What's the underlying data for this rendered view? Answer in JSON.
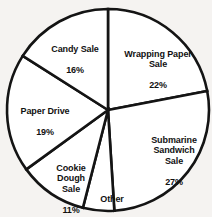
{
  "chart_data": {
    "type": "pie",
    "title": "",
    "subtitle": "",
    "xlabel": "",
    "ylabel": "",
    "legend_position": "none",
    "labels_inside": true,
    "units": "percent",
    "total": 100,
    "start_angle_deg": 0,
    "direction": "clockwise",
    "categories": [
      "Wrapping Paper Sale",
      "Submarine Sandwich Sale",
      "Other",
      "Cookie Dough Sale",
      "Paper Drive",
      "Candy Sale"
    ],
    "values": [
      22,
      27,
      5,
      11,
      19,
      16
    ],
    "slices": [
      {
        "key": "wrapping-paper",
        "name": "Wrapping Paper Sale",
        "name_lines": "Wrapping Paper\nSale",
        "value": 22,
        "value_label": "22%",
        "fill": "#ffffff",
        "stroke": "#141414"
      },
      {
        "key": "submarine",
        "name": "Submarine Sandwich Sale",
        "name_lines": "Submarine\nSandwich\nSale",
        "value": 27,
        "value_label": "27%",
        "fill": "#ffffff",
        "stroke": "#141414"
      },
      {
        "key": "other",
        "name": "Other",
        "name_lines": "Other",
        "value": 5,
        "value_label": "5%",
        "fill": "#ffffff",
        "stroke": "#141414"
      },
      {
        "key": "cookie-dough",
        "name": "Cookie Dough Sale",
        "name_lines": "Cookie\nDough\nSale",
        "value": 11,
        "value_label": "11%",
        "fill": "#ffffff",
        "stroke": "#141414"
      },
      {
        "key": "paper-drive",
        "name": "Paper Drive",
        "name_lines": "Paper Drive",
        "value": 19,
        "value_label": "19%",
        "fill": "#ffffff",
        "stroke": "#141414"
      },
      {
        "key": "candy-sale",
        "name": "Candy Sale",
        "name_lines": "Candy Sale",
        "value": 16,
        "value_label": "16%",
        "fill": "#ffffff",
        "stroke": "#141414"
      }
    ],
    "geometry": {
      "cx": 108,
      "cy": 110,
      "r": 101
    },
    "colors": {
      "background": "#f5f3f1",
      "slice_fill": "#ffffff",
      "outline": "#141414",
      "label_text": "#111111"
    }
  }
}
